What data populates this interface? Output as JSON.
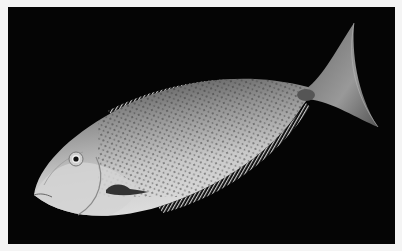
{
  "image": {
    "subject": "fish",
    "description": "Grey spotted unicornfish-like fish on black background",
    "colors": {
      "background": "#050505",
      "border": "#f4f4f4",
      "body_light": "#d8d8d8",
      "body_dark": "#5a5a5a"
    }
  }
}
